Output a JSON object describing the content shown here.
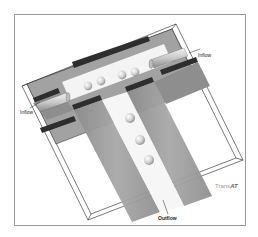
{
  "figure": {
    "labels": {
      "inflow_left": "Inflow",
      "inflow_right": "Inflow",
      "outflow": "Outflow"
    },
    "brand": {
      "prefix": "Trans",
      "suffix": "AT"
    },
    "droplet_count": 9,
    "colors": {
      "frame_border": "#9a9a9a",
      "slab_grey": "#9c9c9c",
      "slab_dark": "#3a3a3a",
      "channel_light": "#ffffff",
      "droplet": "#d6d6d6",
      "outline": "#222222"
    }
  }
}
